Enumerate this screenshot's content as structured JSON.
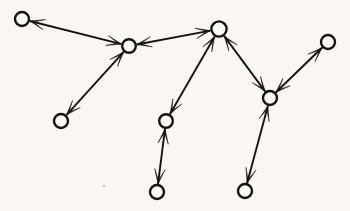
{
  "figure": {
    "caption": "",
    "width": 350,
    "height": 211,
    "background_color": "#f8f7f4",
    "stroke_color": "#141414",
    "node_fill_color": "#fbfaf8"
  },
  "graph_data": {
    "type": "node-link-diagram",
    "directed": true,
    "node_count": 9,
    "edge_count": 8,
    "node_radius_default": 7,
    "nodes": [
      {
        "id": "n1",
        "label": "",
        "x": 22,
        "y": 19,
        "r": 7.0
      },
      {
        "id": "n2",
        "label": "",
        "x": 129,
        "y": 46,
        "r": 6.8
      },
      {
        "id": "n3",
        "label": "",
        "x": 61,
        "y": 121,
        "r": 7.0
      },
      {
        "id": "n4",
        "label": "",
        "x": 219,
        "y": 29,
        "r": 7.6
      },
      {
        "id": "n5",
        "label": "",
        "x": 166,
        "y": 121,
        "r": 6.8
      },
      {
        "id": "n6",
        "label": "",
        "x": 157,
        "y": 192,
        "r": 7.0
      },
      {
        "id": "n7",
        "label": "",
        "x": 270,
        "y": 98,
        "r": 7.0
      },
      {
        "id": "n8",
        "label": "",
        "x": 328,
        "y": 42,
        "r": 7.0
      },
      {
        "id": "n9",
        "label": "",
        "x": 245,
        "y": 191,
        "r": 7.0
      }
    ],
    "edges": [
      {
        "id": "e1",
        "source": "n1",
        "target": "n2",
        "arrow_at_source": true,
        "arrow_at_target": true
      },
      {
        "id": "e2",
        "source": "n3",
        "target": "n2",
        "arrow_at_source": true,
        "arrow_at_target": true
      },
      {
        "id": "e3",
        "source": "n2",
        "target": "n4",
        "arrow_at_source": true,
        "arrow_at_target": true
      },
      {
        "id": "e4",
        "source": "n5",
        "target": "n4",
        "arrow_at_source": true,
        "arrow_at_target": true
      },
      {
        "id": "e5",
        "source": "n6",
        "target": "n5",
        "arrow_at_source": true,
        "arrow_at_target": true
      },
      {
        "id": "e6",
        "source": "n7",
        "target": "n4",
        "arrow_at_source": true,
        "arrow_at_target": true
      },
      {
        "id": "e7",
        "source": "n8",
        "target": "n7",
        "arrow_at_source": true,
        "arrow_at_target": true
      },
      {
        "id": "e8",
        "source": "n9",
        "target": "n7",
        "arrow_at_source": true,
        "arrow_at_target": true
      }
    ],
    "arrow": {
      "length": 15,
      "half_width": 5.2,
      "notch": 4.0
    },
    "specks": [
      {
        "x": 104,
        "y": 186,
        "rx": 1.6,
        "ry": 1.0
      }
    ]
  }
}
